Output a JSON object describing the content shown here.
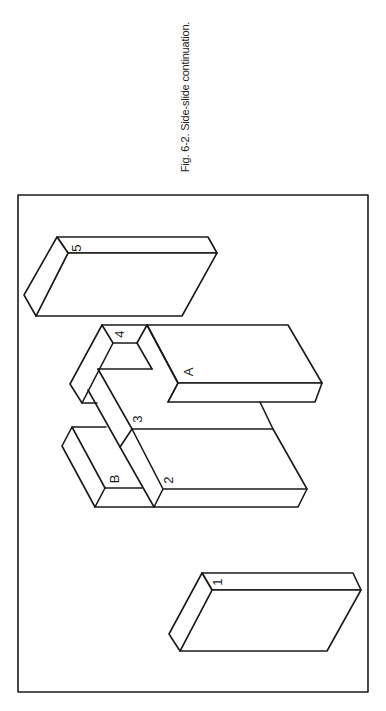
{
  "figure": {
    "caption": "Fig. 6-2. Side-slide continuation.",
    "labels": {
      "block_1": "1",
      "block_2": "2",
      "block_3": "3",
      "block_4": "4",
      "block_5": "5",
      "block_A": "A",
      "block_B": "B"
    }
  },
  "colors": {
    "line": "#1a1a1a",
    "background": "#ffffff"
  }
}
